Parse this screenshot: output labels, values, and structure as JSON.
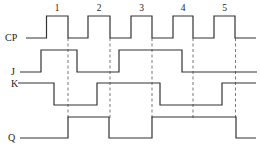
{
  "diagram": {
    "type": "timing-diagram",
    "signals": [
      {
        "name": "CP",
        "label_pos": [
          5,
          41
        ],
        "points": "26,38 46.5,38 46.5,16 68,16 68,38 88,38 88,16 110,16 110,38 131,38 131,16 152,16 152,38 173,38 173,16 193,16 193,38 214,38 214,16 235,16 235,38 256,38"
      },
      {
        "name": "J",
        "label_pos": [
          11,
          75
        ],
        "points": "20,72 41,72 41,50 77,50 77,72 119,72 119,50 182,50 182,72 257,72"
      },
      {
        "name": "K",
        "label_pos": [
          11,
          87
        ],
        "points": "18,83 54,83 54,105 97,105 97,83 160,83 160,105 222,105 222,83 256,83"
      },
      {
        "name": "Q",
        "label_pos": [
          8,
          141
        ],
        "points": "20,138 68,138 68,117 109,117 109,138 152,138 152,117 236,117 236,138 256,138"
      }
    ],
    "clock_pulses": [
      {
        "label": "1",
        "x": 57
      },
      {
        "label": "2",
        "x": 99
      },
      {
        "label": "3",
        "x": 141.5
      },
      {
        "label": "4",
        "x": 183
      },
      {
        "label": "5",
        "x": 224.5
      }
    ],
    "falling_edges_x": [
      68,
      110,
      152,
      193,
      235.5
    ],
    "dash_y_range": [
      38,
      118
    ],
    "line_color": "#333333"
  }
}
